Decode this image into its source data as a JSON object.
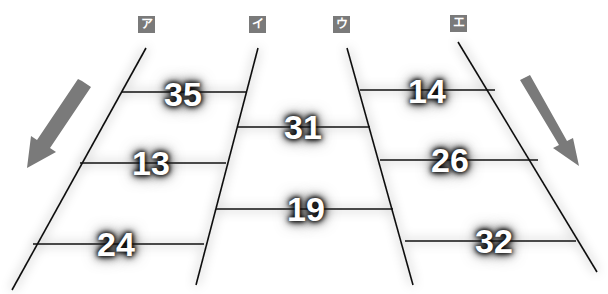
{
  "header_cut_text": "",
  "columns": [
    {
      "label": "ア",
      "x": 146
    },
    {
      "label": "イ",
      "x": 258
    },
    {
      "label": "ウ",
      "x": 347
    },
    {
      "label": "エ",
      "x": 458
    }
  ],
  "rungs": [
    {
      "between": "ア-イ",
      "value": "35"
    },
    {
      "between": "ア-イ",
      "value": "13"
    },
    {
      "between": "ア-イ",
      "value": "24"
    },
    {
      "between": "イ-ウ",
      "value": "31"
    },
    {
      "between": "イ-ウ",
      "value": "19"
    },
    {
      "between": "ウ-エ",
      "value": "14"
    },
    {
      "between": "ウ-エ",
      "value": "26"
    },
    {
      "between": "ウ-エ",
      "value": "32"
    }
  ],
  "arrows": {
    "left": "arrow-down-left",
    "right": "arrow-down-right",
    "color": "#7a7a7a"
  },
  "colors": {
    "line": "#111111",
    "label_bg": "#7a7a7a",
    "number_text": "#ffffff"
  }
}
